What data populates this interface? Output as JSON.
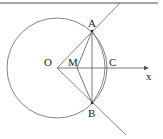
{
  "diagram": {
    "colors": {
      "stroke": "#555555",
      "text": "#222222",
      "border": "#777777"
    },
    "circle": {
      "cx": 57,
      "cy": 68,
      "r": 50
    },
    "points": {
      "O": {
        "label": "O",
        "x": 57,
        "y": 68
      },
      "A": {
        "label": "A",
        "x": 92,
        "y": 31
      },
      "B": {
        "label": "B",
        "x": 92,
        "y": 103
      },
      "M": {
        "label": "M",
        "x": 77,
        "y": 68
      },
      "C": {
        "label": "C",
        "x": 107,
        "y": 68
      }
    },
    "axis": {
      "label": "x"
    }
  }
}
